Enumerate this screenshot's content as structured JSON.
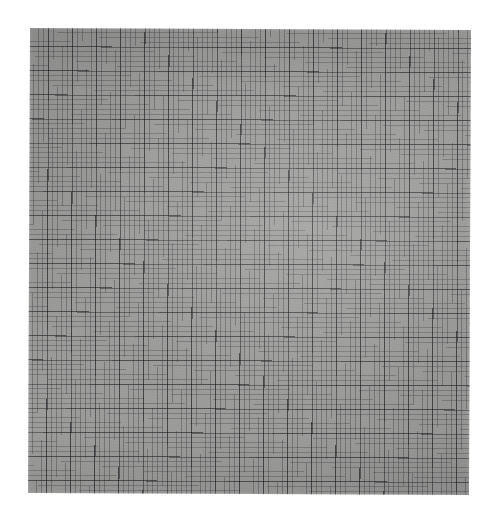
{
  "image": {
    "kind": "scanned-graph-paper",
    "title": "Sheet of gray graph paper",
    "canvas": {
      "width_px": 499,
      "height_px": 521,
      "background_color": "#ffffff"
    }
  },
  "paper": {
    "name": "graph-paper-sheet",
    "left_px": 29,
    "top_px": 29,
    "width_px": 441,
    "height_px": 465,
    "base_color": "#9d9d9b",
    "tone": "medium warm gray",
    "rotation_deg": 0.25
  },
  "grid": {
    "minor": {
      "pitch_px": 4.82,
      "line_width_px": 0.7,
      "color": "#606268",
      "opacity": 0.4,
      "columns": 91,
      "rows": 96
    },
    "major": {
      "pitch_px": 24.1,
      "line_width_px": 1.05,
      "color": "#40424a",
      "opacity": 0.58,
      "minor_cells_per_major": 5,
      "columns": 18,
      "rows": 19
    },
    "orientation": "orthogonal",
    "has_labels": false,
    "has_text": false
  },
  "chart_data": {
    "type": "table",
    "title": "",
    "xlabel": "",
    "ylabel": "",
    "categories": [],
    "values": [],
    "note": "Blank graph paper — no plotted data, no tick labels, no legend, no annotations."
  }
}
